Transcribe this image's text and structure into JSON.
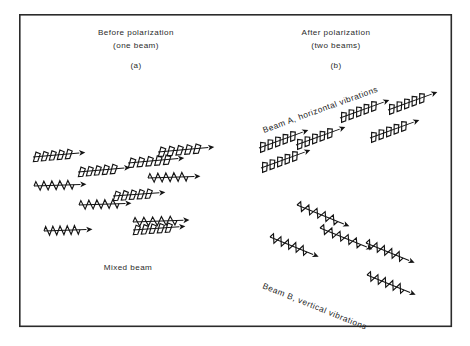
{
  "figure": {
    "kind": "physics-diagram",
    "background_color": "#ffffff",
    "ink_color": "#141414",
    "frame": {
      "x": 19,
      "y": 14,
      "width": 433,
      "height": 313,
      "stroke": "#2b2b2b"
    }
  },
  "labels": {
    "panel_a": {
      "line1": "Before polarization",
      "line2": "(one beam)",
      "tag": "(a)",
      "bottom": "Mixed beam"
    },
    "panel_b": {
      "line1": "After polarization",
      "line2": "(two beams)",
      "tag": "(b)",
      "beam_a": "Beam A, horizontal vibrations",
      "beam_b": "Beam B, vertical vibrations"
    }
  },
  "chart_data": {
    "type": "diagram",
    "wave_types": {
      "horizontal": {
        "name": "horizontal-vibration-wave",
        "glyph": "slanted saw-tooth zig-zag along a straight shaft with arrowhead",
        "description": "Represents light vibrating in the horizontal plane"
      },
      "vertical": {
        "name": "vertical-vibration-wave",
        "glyph": "triangular up-down zig-zag along a straight shaft with arrowhead",
        "description": "Represents light vibrating in the vertical plane"
      }
    },
    "panel_a_waves": [
      {
        "type": "horizontal",
        "x": 33,
        "y": 157,
        "length": 48,
        "angle": -5
      },
      {
        "type": "horizontal",
        "x": 78,
        "y": 172,
        "length": 48,
        "angle": -5
      },
      {
        "type": "horizontal",
        "x": 128,
        "y": 163,
        "length": 52,
        "angle": -5
      },
      {
        "type": "horizontal",
        "x": 158,
        "y": 152,
        "length": 52,
        "angle": -5
      },
      {
        "type": "horizontal",
        "x": 113,
        "y": 196,
        "length": 48,
        "angle": -4
      },
      {
        "type": "horizontal",
        "x": 133,
        "y": 230,
        "length": 48,
        "angle": -4
      },
      {
        "type": "vertical",
        "x": 34,
        "y": 186,
        "length": 48,
        "angle": -2
      },
      {
        "type": "vertical",
        "x": 79,
        "y": 205,
        "length": 48,
        "angle": -2
      },
      {
        "type": "vertical",
        "x": 148,
        "y": 178,
        "length": 48,
        "angle": -2
      },
      {
        "type": "vertical",
        "x": 44,
        "y": 231,
        "length": 44,
        "angle": -2
      },
      {
        "type": "vertical",
        "x": 133,
        "y": 222,
        "length": 52,
        "angle": -2
      }
    ],
    "panel_b_beam_a_waves": [
      {
        "type": "horizontal",
        "x": 259,
        "y": 148,
        "length": 48,
        "angle": -20
      },
      {
        "type": "horizontal",
        "x": 296,
        "y": 145,
        "length": 48,
        "angle": -20
      },
      {
        "type": "horizontal",
        "x": 340,
        "y": 118,
        "length": 48,
        "angle": -20
      },
      {
        "type": "horizontal",
        "x": 388,
        "y": 110,
        "length": 48,
        "angle": -20
      },
      {
        "type": "horizontal",
        "x": 261,
        "y": 168,
        "length": 48,
        "angle": -20
      },
      {
        "type": "horizontal",
        "x": 370,
        "y": 138,
        "length": 48,
        "angle": -20
      }
    ],
    "panel_b_beam_b_waves": [
      {
        "type": "vertical",
        "x": 297,
        "y": 205,
        "length": 52,
        "angle": 22
      },
      {
        "type": "vertical",
        "x": 270,
        "y": 237,
        "length": 48,
        "angle": 22
      },
      {
        "type": "vertical",
        "x": 320,
        "y": 228,
        "length": 52,
        "angle": 22
      },
      {
        "type": "vertical",
        "x": 366,
        "y": 243,
        "length": 48,
        "angle": 22
      },
      {
        "type": "vertical",
        "x": 367,
        "y": 275,
        "length": 48,
        "angle": 22
      }
    ],
    "annotations": [
      {
        "text": "Beam A, horizontal vibrations",
        "x": 264,
        "y": 133,
        "angle": -20
      },
      {
        "text": "Beam B, vertical vibrations",
        "x": 262,
        "y": 290,
        "angle": 22
      },
      {
        "text": "Mixed beam",
        "x": 128,
        "y": 267,
        "angle": 0
      }
    ]
  }
}
